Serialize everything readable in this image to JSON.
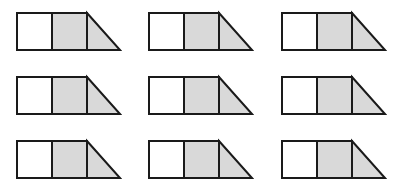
{
  "diagram": {
    "colors": {
      "background": "#ffffff",
      "stroke": "#1a1a1a",
      "empty_fill": "#ffffff",
      "shaded_fill": "#d9d9d9"
    },
    "stroke_width": 2,
    "shape": {
      "square_width": 35,
      "height": 37,
      "triangle_width": 33,
      "parts": [
        {
          "type": "square",
          "shaded": false
        },
        {
          "type": "square",
          "shaded": true
        },
        {
          "type": "triangle",
          "shaded": true
        }
      ]
    },
    "columns_x": [
      17,
      149,
      282
    ],
    "rows_y": [
      13,
      77,
      141
    ],
    "shapes": [
      {
        "row": 0,
        "col": 0
      },
      {
        "row": 0,
        "col": 1
      },
      {
        "row": 0,
        "col": 2
      },
      {
        "row": 1,
        "col": 0
      },
      {
        "row": 1,
        "col": 1
      },
      {
        "row": 1,
        "col": 2
      },
      {
        "row": 2,
        "col": 0
      },
      {
        "row": 2,
        "col": 1
      },
      {
        "row": 2,
        "col": 2
      }
    ]
  }
}
